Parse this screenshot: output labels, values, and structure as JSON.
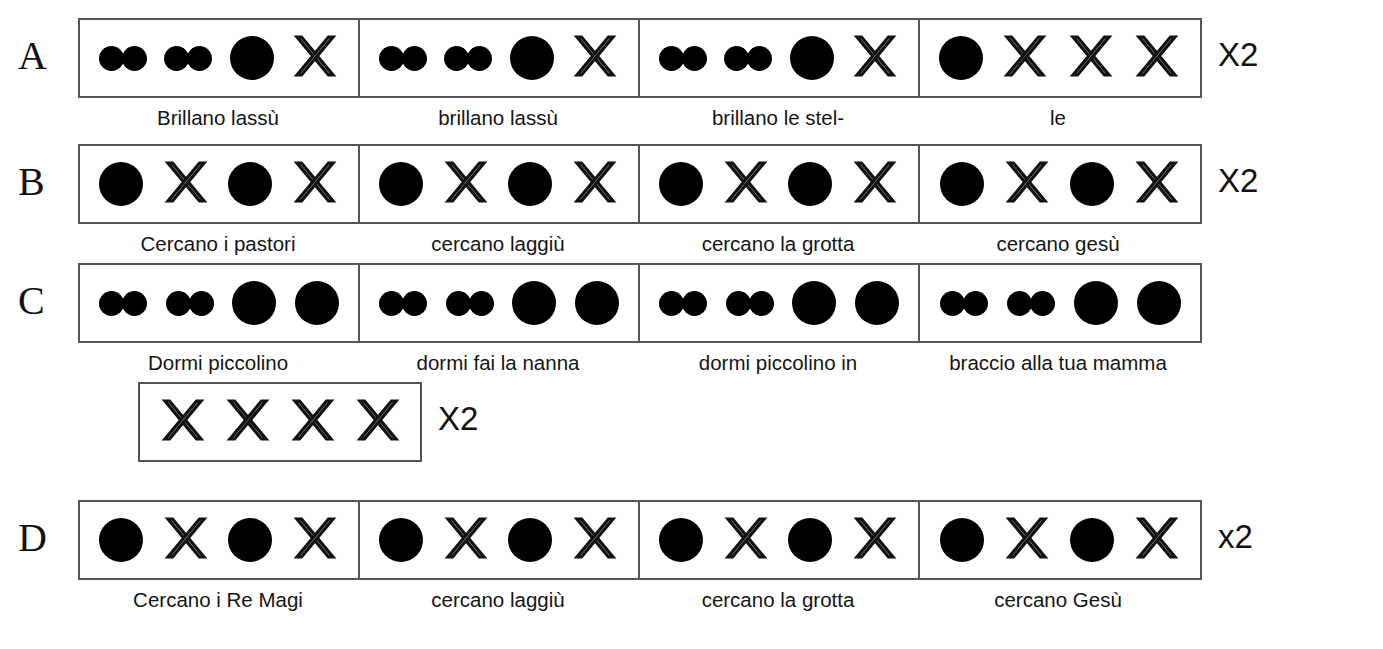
{
  "document": {
    "kind": "rhythm-notation-chart",
    "language": "Italian",
    "symbols": {
      "big-dot": "quarter-note",
      "pair-dots": "two-eighth-notes",
      "cross": "rest"
    }
  },
  "staves": [
    {
      "id": "A",
      "letter": "A",
      "repeat": "X2",
      "measure_width": 280,
      "measures": [
        {
          "beats": [
            "pair",
            "pair",
            "big",
            "cross"
          ],
          "caption": "Brillano lassù"
        },
        {
          "beats": [
            "pair",
            "pair",
            "big",
            "cross"
          ],
          "caption": "brillano lassù"
        },
        {
          "beats": [
            "pair",
            "pair",
            "big",
            "cross"
          ],
          "caption": "brillano le stel-"
        },
        {
          "beats": [
            "big",
            "cross",
            "cross",
            "cross"
          ],
          "caption": "le"
        }
      ]
    },
    {
      "id": "B",
      "letter": "B",
      "repeat": "X2",
      "measure_width": 280,
      "measures": [
        {
          "beats": [
            "big",
            "cross",
            "big",
            "cross"
          ],
          "caption": "Cercano i pastori"
        },
        {
          "beats": [
            "big",
            "cross",
            "big",
            "cross"
          ],
          "caption": "cercano laggiù"
        },
        {
          "beats": [
            "big",
            "cross",
            "big",
            "cross"
          ],
          "caption": "cercano la grotta"
        },
        {
          "beats": [
            "big",
            "cross",
            "big",
            "cross"
          ],
          "caption": "cercano gesù"
        }
      ]
    },
    {
      "id": "C",
      "letter": "C",
      "repeat": "",
      "measure_width": 280,
      "measures": [
        {
          "beats": [
            "pair",
            "pair",
            "big",
            "big"
          ],
          "caption": "Dormi piccolino"
        },
        {
          "beats": [
            "pair",
            "pair",
            "big",
            "big"
          ],
          "caption": "dormi fai la nanna"
        },
        {
          "beats": [
            "pair",
            "pair",
            "big",
            "big"
          ],
          "caption": "dormi piccolino in"
        },
        {
          "beats": [
            "pair",
            "pair",
            "big",
            "big"
          ],
          "caption": "braccio alla tua mamma"
        }
      ]
    },
    {
      "id": "C2",
      "letter": "",
      "repeat": "X2",
      "measure_width": 280,
      "measures": [
        {
          "beats": [
            "cross",
            "cross",
            "cross",
            "cross"
          ],
          "caption": ""
        }
      ]
    },
    {
      "id": "D",
      "letter": "D",
      "repeat": "x2",
      "measure_width": 280,
      "measures": [
        {
          "beats": [
            "big",
            "cross",
            "big",
            "cross"
          ],
          "caption": "Cercano i Re Magi"
        },
        {
          "beats": [
            "big",
            "cross",
            "big",
            "cross"
          ],
          "caption": "cercano laggiù"
        },
        {
          "beats": [
            "big",
            "cross",
            "big",
            "cross"
          ],
          "caption": "cercano la grotta"
        },
        {
          "beats": [
            "big",
            "cross",
            "big",
            "cross"
          ],
          "caption": "cercano Gesù"
        }
      ]
    }
  ],
  "colors": {
    "ink": "#000000",
    "rule": "#555555",
    "page": "#ffffff"
  }
}
